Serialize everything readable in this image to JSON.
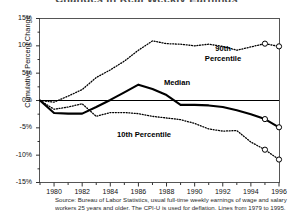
{
  "figure": {
    "title_clipped": "Changes in Real Weekly Earnings",
    "source_note": "Source: Bureau of Labor Statistics, usual full-time weekly earnings of wage and salary workers 25 years and older. The CPI-U is used for deflation. Lines from 1979 to 1995."
  },
  "labels": {
    "p90": "90th",
    "p90_second": "Percentile",
    "median": "Median",
    "p10": "10th Percentile"
  },
  "chart_data": {
    "type": "line",
    "title": "Changes in Real Weekly Earnings",
    "xlabel": "",
    "ylabel": "Cumulative Percent Change",
    "xlim": [
      1979,
      1996
    ],
    "ylim": [
      -15,
      15
    ],
    "grid": false,
    "legend_position": "inline-annotations",
    "yticks": [
      15,
      10,
      5,
      0,
      -5,
      -10,
      -15
    ],
    "ytick_labels": [
      "15%",
      "10%",
      "5%",
      "0%",
      "-5%",
      "-10%",
      "-15%"
    ],
    "xticks": [
      1980,
      1982,
      1984,
      1986,
      1988,
      1990,
      1992,
      1994,
      1996
    ],
    "xtick_labels": [
      "1980",
      "1982",
      "1984",
      "1986",
      "1988",
      "1990",
      "1992",
      "1994",
      "1996"
    ],
    "minor_xticks": [
      1979,
      1981,
      1983,
      1985,
      1987,
      1989,
      1991,
      1993,
      1995
    ],
    "x": [
      1979,
      1980,
      1981,
      1982,
      1983,
      1984,
      1985,
      1986,
      1987,
      1988,
      1989,
      1990,
      1991,
      1992,
      1993,
      1994,
      1995,
      1996
    ],
    "series": [
      {
        "name": "90th Percentile",
        "style": "dotted",
        "color": "#000000",
        "marker_years": [
          1995,
          1996
        ],
        "values": [
          0.0,
          -0.3,
          0.8,
          2.0,
          4.2,
          5.6,
          7.2,
          9.2,
          10.9,
          10.4,
          10.3,
          10.0,
          10.3,
          9.9,
          9.2,
          9.8,
          10.4,
          9.9
        ]
      },
      {
        "name": "Median",
        "style": "solid",
        "color": "#000000",
        "marker_years": [
          1995,
          1996
        ],
        "values": [
          0.0,
          -2.3,
          -2.4,
          -2.4,
          -1.2,
          0.1,
          1.5,
          2.9,
          2.1,
          1.0,
          -0.8,
          -0.8,
          -0.9,
          -1.2,
          -1.8,
          -2.5,
          -3.4,
          -4.9
        ]
      },
      {
        "name": "10th Percentile",
        "style": "dotted",
        "color": "#000000",
        "marker_years": [
          1995,
          1996
        ],
        "values": [
          0.0,
          -1.6,
          -1.2,
          -0.6,
          -2.9,
          -2.2,
          -2.2,
          -2.4,
          -2.9,
          -3.2,
          -3.5,
          -4.2,
          -5.2,
          -5.6,
          -5.5,
          -7.6,
          -9.0,
          -10.8
        ]
      }
    ]
  }
}
